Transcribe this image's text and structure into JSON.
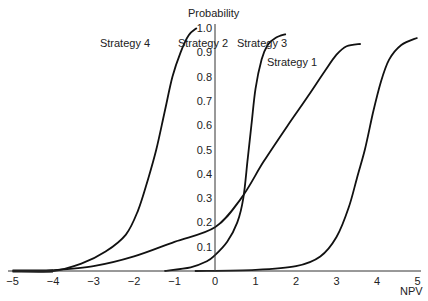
{
  "chart_data": {
    "type": "line",
    "title": "",
    "xlabel": "NPV",
    "ylabel": "Probability",
    "xlim": [
      -5,
      5
    ],
    "ylim": [
      0,
      1.0
    ],
    "x_ticks": [
      -5,
      -4,
      -3,
      -2,
      -1,
      0,
      1,
      2,
      3,
      4,
      5
    ],
    "x_tick_labels": [
      "−5",
      "−4",
      "−3",
      "−2",
      "−1",
      "0",
      "1",
      "2",
      "3",
      "4",
      "5"
    ],
    "y_ticks": [
      0.1,
      0.2,
      0.3,
      0.4,
      0.5,
      0.6,
      0.7,
      0.8,
      0.9,
      1.0
    ],
    "y_tick_labels": [
      "0.1",
      "0.2",
      "0.3",
      "0.4",
      "0.5",
      "0.6",
      "0.7",
      "0.8",
      "0.9",
      "1.0"
    ],
    "grid": false,
    "legend_position": "inline labels near curve ends",
    "series": [
      {
        "name": "Strategy 1",
        "label_pos": [
          292,
          66
        ],
        "points": [
          [
            -0.5,
            0.0
          ],
          [
            1.0,
            0.005
          ],
          [
            2.0,
            0.02
          ],
          [
            2.6,
            0.06
          ],
          [
            3.0,
            0.14
          ],
          [
            3.3,
            0.26
          ],
          [
            3.5,
            0.38
          ],
          [
            3.7,
            0.5
          ],
          [
            3.9,
            0.65
          ],
          [
            4.1,
            0.78
          ],
          [
            4.3,
            0.87
          ],
          [
            4.6,
            0.93
          ],
          [
            5.0,
            0.96
          ]
        ]
      },
      {
        "name": "Strategy 2",
        "label_pos": [
          203,
          47
        ],
        "points": [
          [
            -1.25,
            0.0
          ],
          [
            -0.6,
            0.015
          ],
          [
            -0.2,
            0.04
          ],
          [
            0.0,
            0.065
          ],
          [
            0.3,
            0.12
          ],
          [
            0.55,
            0.2
          ],
          [
            0.7,
            0.3
          ],
          [
            0.8,
            0.45
          ],
          [
            0.9,
            0.6
          ],
          [
            1.0,
            0.75
          ],
          [
            1.15,
            0.87
          ],
          [
            1.3,
            0.93
          ],
          [
            1.5,
            0.96
          ],
          [
            1.75,
            0.975
          ]
        ]
      },
      {
        "name": "Strategy 3",
        "label_pos": [
          262,
          47
        ],
        "points": [
          [
            -4.2,
            0.0
          ],
          [
            -3.0,
            0.02
          ],
          [
            -2.0,
            0.06
          ],
          [
            -1.0,
            0.12
          ],
          [
            0.0,
            0.18
          ],
          [
            0.65,
            0.3
          ],
          [
            1.2,
            0.45
          ],
          [
            1.8,
            0.6
          ],
          [
            2.3,
            0.72
          ],
          [
            2.7,
            0.82
          ],
          [
            3.0,
            0.89
          ],
          [
            3.25,
            0.925
          ],
          [
            3.6,
            0.935
          ]
        ]
      },
      {
        "name": "Strategy 4",
        "label_pos": [
          125,
          47
        ],
        "points": [
          [
            -5.0,
            0.0
          ],
          [
            -4.0,
            0.0
          ],
          [
            -3.3,
            0.03
          ],
          [
            -2.7,
            0.08
          ],
          [
            -2.2,
            0.15
          ],
          [
            -1.9,
            0.25
          ],
          [
            -1.65,
            0.38
          ],
          [
            -1.45,
            0.5
          ],
          [
            -1.25,
            0.65
          ],
          [
            -1.05,
            0.8
          ],
          [
            -0.85,
            0.9
          ],
          [
            -0.65,
            0.97
          ],
          [
            -0.45,
            1.0
          ]
        ]
      }
    ]
  }
}
